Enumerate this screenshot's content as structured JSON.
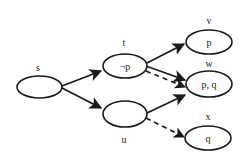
{
  "diagram": {
    "type": "state-transition-graph",
    "stroke_color": "#1a1a1a",
    "background": "#ffffff",
    "nodes": [
      {
        "id": "s",
        "label": "s",
        "content": "",
        "cx": 39.5,
        "cy": 87,
        "rx": 22.5,
        "ry": 11,
        "label_x": 38,
        "label_y": 71
      },
      {
        "id": "t",
        "label": "t",
        "content": "¬p",
        "cx": 125,
        "cy": 66,
        "rx": 22,
        "ry": 12,
        "label_x": 124,
        "label_y": 46
      },
      {
        "id": "u",
        "label": "u",
        "content": "",
        "cx": 125,
        "cy": 114,
        "rx": 22,
        "ry": 13,
        "label_x": 124,
        "label_y": 143
      },
      {
        "id": "v",
        "label": "v",
        "content": "p",
        "cx": 209,
        "cy": 42,
        "rx": 23,
        "ry": 12,
        "label_x": 209,
        "label_y": 24
      },
      {
        "id": "w",
        "label": "w",
        "content": "p, q",
        "cx": 209,
        "cy": 84,
        "rx": 23,
        "ry": 13,
        "label_x": 209,
        "label_y": 67
      },
      {
        "id": "x",
        "label": "x",
        "content": "q",
        "cx": 208,
        "cy": 138,
        "rx": 23,
        "ry": 12,
        "label_x": 208,
        "label_y": 120
      }
    ],
    "edges": [
      {
        "from": "s",
        "to": "t",
        "style": "solid"
      },
      {
        "from": "s",
        "to": "u",
        "style": "solid"
      },
      {
        "from": "t",
        "to": "v",
        "style": "solid"
      },
      {
        "from": "t",
        "to": "w",
        "style": "solid"
      },
      {
        "from": "t",
        "to": "w",
        "style": "dashed"
      },
      {
        "from": "u",
        "to": "w",
        "style": "solid"
      },
      {
        "from": "u",
        "to": "x",
        "style": "dashed"
      }
    ]
  }
}
